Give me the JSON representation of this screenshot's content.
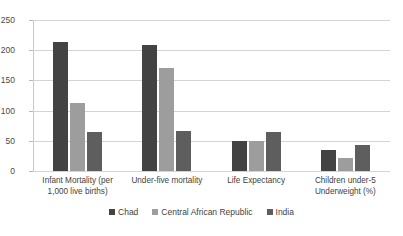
{
  "chart_data": {
    "type": "bar",
    "title": "",
    "subtitle": "",
    "xlabel": "",
    "ylabel": "",
    "ylim": [
      0,
      250
    ],
    "yticks": [
      0,
      50,
      100,
      150,
      200,
      250
    ],
    "ytick_labels": [
      "0",
      "50",
      "100",
      "150",
      "200",
      "250"
    ],
    "grid": true,
    "legend_position": "bottom",
    "categories": [
      "Infant  Mortality (per\n1,000 live births)",
      "Under-five mortality",
      "Life Expectancy",
      "Children under-5\nUnderweight (%)"
    ],
    "series": [
      {
        "name": "Chad",
        "color": "#434343",
        "values": [
          213,
          209,
          49,
          34
        ]
      },
      {
        "name": "Central African Republic",
        "color": "#9d9d9d",
        "values": [
          112,
          171,
          49,
          22
        ]
      },
      {
        "name": "India",
        "color": "#5e5e5e",
        "values": [
          65,
          66,
          65,
          43
        ]
      }
    ]
  },
  "legend": {
    "items": [
      {
        "label": "Chad",
        "color": "#434343"
      },
      {
        "label": "Central African Republic",
        "color": "#9d9d9d"
      },
      {
        "label": "India",
        "color": "#5e5e5e"
      }
    ]
  },
  "colors": {
    "background": "#ffffff",
    "gridline": "#d4d4d4",
    "axis": "#c8c8c8",
    "text": "#3f3f3f"
  }
}
